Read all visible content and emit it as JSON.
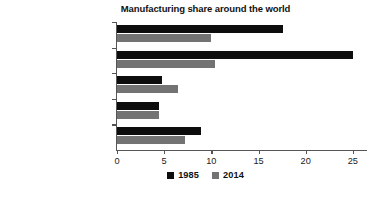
{
  "chart_data": {
    "type": "bar",
    "orientation": "horizontal",
    "title": "Manufacturing share around the world",
    "xlabel": "",
    "ylabel": "",
    "categories": [
      "'Old' OECD countries",
      "Former Soviet sphere",
      "Developing countries",
      "Developing w/o China",
      "World total"
    ],
    "series": [
      {
        "name": "1985",
        "color": "#0d0d0d",
        "values": [
          17.6,
          25.0,
          4.8,
          4.5,
          8.9
        ]
      },
      {
        "name": "2014",
        "color": "#737373",
        "values": [
          10.0,
          10.4,
          6.5,
          4.5,
          7.2
        ]
      }
    ],
    "xlim": [
      0,
      26.5
    ],
    "xticks": [
      0,
      5,
      10,
      15,
      20,
      25
    ],
    "xtick_labels": [
      "0",
      "5",
      "10",
      "15",
      "20",
      "25"
    ],
    "grid": false,
    "legend_position": "bottom-center"
  }
}
